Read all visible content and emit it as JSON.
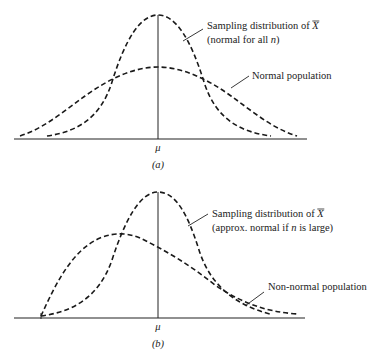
{
  "panels": [
    {
      "id": "a",
      "caption": "(a)",
      "axis_label": "μ",
      "sampling_label_line1": "Sampling distribution of ",
      "sampling_label_symbol": "X",
      "sampling_label_line2_prefix": "(normal for all ",
      "sampling_label_line2_var": "n",
      "sampling_label_line2_suffix": ")",
      "population_label": "Normal population"
    },
    {
      "id": "b",
      "caption": "(b)",
      "axis_label": "μ",
      "sampling_label_line1": "Sampling distribution of ",
      "sampling_label_symbol": "X",
      "sampling_label_line2_prefix": "(approx. normal if ",
      "sampling_label_line2_var": "n",
      "sampling_label_line2_suffix": " is large)",
      "population_label": "Non-normal population"
    }
  ],
  "style": {
    "line_color": "#1a1a1a",
    "background": "#ffffff"
  }
}
